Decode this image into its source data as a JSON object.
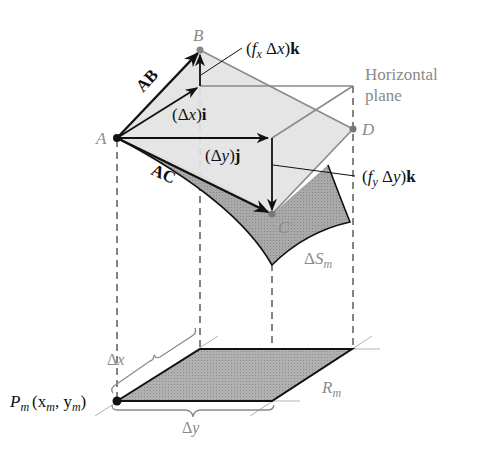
{
  "figure": {
    "type": "surface-area-element-diagram",
    "points": {
      "A": {
        "label": "A"
      },
      "B": {
        "label": "B"
      },
      "C": {
        "label": "C"
      },
      "D": {
        "label": "D"
      },
      "Pm": {
        "label": "P",
        "sub": "m",
        "coords": "(x",
        "coords_sub1": "m",
        "coords_mid": ", y",
        "coords_sub2": "m",
        "coords_end": ")"
      }
    },
    "vectors": {
      "AB": {
        "label": "AB"
      },
      "AC": {
        "label": "AC"
      },
      "dx_i": {
        "open": "(Δ",
        "var": "x",
        "close": ")",
        "unit": "i"
      },
      "dy_j": {
        "open": "(Δ",
        "var": "y",
        "close": ")",
        "unit": "j"
      },
      "fx_k": {
        "open": "(",
        "f": "f",
        "sub": "x",
        "mid": " Δ",
        "var": "x",
        "close": ")",
        "unit": "k"
      },
      "fy_k": {
        "open": "(",
        "f": "f",
        "sub": "y",
        "mid": " Δ",
        "var": "y",
        "close": ")",
        "unit": "k"
      }
    },
    "labels": {
      "horizontal_plane_line1": "Horizontal",
      "horizontal_plane_line2": "plane",
      "surface_delta": "Δ",
      "surface_S": "S",
      "surface_sub": "m",
      "region_R": "R",
      "region_sub": "m",
      "brace_dx_delta": "Δ",
      "brace_dx_var": "x",
      "brace_dy_delta": "Δ",
      "brace_dy_var": "y"
    },
    "colors": {
      "tangent_plane_fill": "#e2e2e2",
      "surface_fill": "#a8a8a8",
      "region_fill": "#b5b5b5",
      "label_gray": "#8a8a8a",
      "ink": "#111111"
    }
  }
}
